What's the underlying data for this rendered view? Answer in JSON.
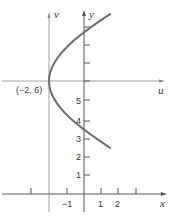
{
  "diagram": {
    "type": "coordinate-translation-parabola",
    "axes": {
      "x_label": "x",
      "y_label": "y",
      "u_label": "u",
      "v_label": "v"
    },
    "vertex_label": "(−2, 6)",
    "x_ticks": [
      {
        "value": -1,
        "label": "−1"
      },
      {
        "value": 1,
        "label": "1"
      },
      {
        "value": 2,
        "label": "2"
      }
    ],
    "y_ticks": [
      {
        "value": 1,
        "label": "1"
      },
      {
        "value": 2,
        "label": "2"
      },
      {
        "value": 3,
        "label": "3"
      },
      {
        "value": 4,
        "label": "4"
      },
      {
        "value": 5,
        "label": "5"
      }
    ],
    "curve": {
      "equation": "(y − 6)^2 = 4(x + 2)",
      "vertex": [
        -2,
        6
      ],
      "y_range": [
        2.26,
        9.74
      ]
    },
    "colors": {
      "axis": "#555555",
      "curve": "#6e6e6e",
      "text": "#333333"
    }
  }
}
